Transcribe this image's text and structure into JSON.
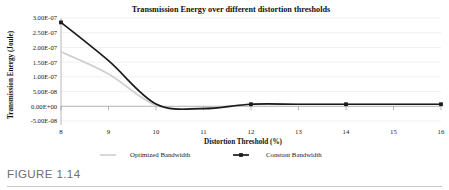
{
  "figure": {
    "caption_label": "FIGURE 1.14"
  },
  "chart_data": {
    "type": "line",
    "title": "Transmission Energy over different distortion thresholds",
    "xlabel": "Distortion Threshold (%)",
    "ylabel": "Transmission Energy (Joule)",
    "x": [
      8,
      9,
      10,
      11,
      12,
      13,
      14,
      15,
      16
    ],
    "xlim": [
      8,
      16
    ],
    "ylim": [
      -5e-08,
      3e-07
    ],
    "xticks": [
      8,
      9,
      10,
      11,
      12,
      13,
      14,
      15,
      16
    ],
    "xtick_labels": [
      "8",
      "9",
      "10",
      "11",
      "12",
      "13",
      "14",
      "15",
      "16"
    ],
    "yticks": [
      -5e-08,
      0.0,
      5e-08,
      1e-07,
      1.5e-07,
      2e-07,
      2.5e-07,
      3e-07
    ],
    "ytick_labels": [
      "-5.00E-08",
      "0.00E+00",
      "5.00E-08",
      "1.00E-07",
      "1.50E-07",
      "2.00E-07",
      "2.50E-07",
      "3.00E-07"
    ],
    "grid": true,
    "grid_axis": "y",
    "legend_position": "bottom",
    "series": [
      {
        "name": "Optimized Bandwidth",
        "color": "#d0d0d0",
        "marker": "none",
        "values": [
          1.85e-07,
          1.1e-07,
          3e-09,
          -6e-09,
          7e-09,
          7e-09,
          7e-09,
          7e-09,
          7e-09
        ]
      },
      {
        "name": "Constant Bandwidth",
        "color": "#1b1b1b",
        "marker": "square",
        "marker_x": [
          8,
          12,
          14,
          16
        ],
        "values": [
          2.85e-07,
          1.55e-07,
          8e-09,
          -8e-09,
          7e-09,
          7e-09,
          7e-09,
          7e-09,
          7e-09
        ]
      }
    ]
  }
}
